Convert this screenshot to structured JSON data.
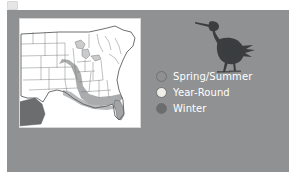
{
  "figure": {
    "background_color": "#ffffff",
    "panel_color": "#8f9193"
  },
  "map": {
    "name": "us-range-map",
    "background_color": "#ffffff",
    "outline_color": "#5d5f61",
    "water_color": "#6e7072",
    "region_fills": {
      "spring_summer": "#8e9092",
      "year_round": "#efeee9",
      "winter": "#6b6d6f"
    }
  },
  "bird": {
    "name": "heron-silhouette",
    "color": "#3a3c3e",
    "facing": "left"
  },
  "legend": {
    "items": [
      {
        "label": "Spring/Summer",
        "color": "#8e9092",
        "icon": "circle-swatch-icon"
      },
      {
        "label": "Year-Round",
        "color": "#efeee9",
        "icon": "circle-swatch-icon"
      },
      {
        "label": "Winter",
        "color": "#6b6d6f",
        "icon": "circle-swatch-icon"
      }
    ],
    "text_color": "#ffffff"
  }
}
